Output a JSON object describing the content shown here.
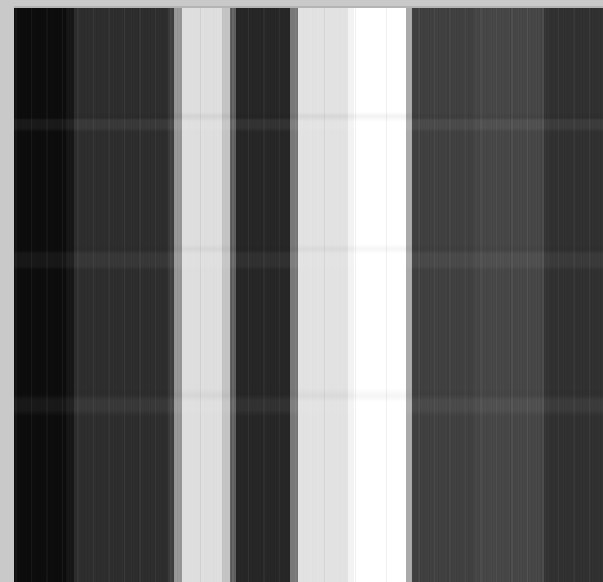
{
  "figure": {
    "title": "",
    "type": "grayscale-vertical-band-raster",
    "width_px": 603,
    "height_px": 582,
    "background_color": "#c9c9c9",
    "plot_area": {
      "left_px": 14,
      "top_px": 8,
      "width_px": 589,
      "height_px": 574
    },
    "colormap": "gray",
    "border": {
      "top_strip_color": "#c9c9c9",
      "top_strip_height_px": 8,
      "left_strip_color": "#c9c9c9",
      "left_strip_width_px": 14,
      "hairline_color": "#b4b4b4"
    }
  },
  "chart_data": {
    "type": "heatmap",
    "title": "",
    "xlabel": "",
    "ylabel": "",
    "grid": false,
    "legend": "none",
    "colormap": "gray",
    "value_range": [
      0,
      255
    ],
    "orientation": "vertical-bands",
    "xlim": [
      0,
      589
    ],
    "ylim": [
      0,
      574
    ],
    "horizontal_seams_y": [
      116,
      250,
      396
    ],
    "columns": [
      {
        "x_start": 0,
        "x_end": 52,
        "gray": 12,
        "hex": "#0c0c0c",
        "label": "very-dark-1"
      },
      {
        "x_start": 52,
        "x_end": 60,
        "gray": 22,
        "hex": "#161616",
        "label": "very-dark-2"
      },
      {
        "x_start": 60,
        "x_end": 154,
        "gray": 45,
        "hex": "#2d2d2d",
        "label": "dark-1"
      },
      {
        "x_start": 154,
        "x_end": 160,
        "gray": 60,
        "hex": "#3c3c3c",
        "label": "dark-edge"
      },
      {
        "x_start": 160,
        "x_end": 168,
        "gray": 150,
        "hex": "#969696",
        "label": "ramp-up-1"
      },
      {
        "x_start": 168,
        "x_end": 208,
        "gray": 222,
        "hex": "#dedede",
        "label": "light-1"
      },
      {
        "x_start": 208,
        "x_end": 216,
        "gray": 196,
        "hex": "#c4c4c4",
        "label": "light-1-edge"
      },
      {
        "x_start": 216,
        "x_end": 222,
        "gray": 96,
        "hex": "#606060",
        "label": "ramp-down-1"
      },
      {
        "x_start": 222,
        "x_end": 276,
        "gray": 38,
        "hex": "#262626",
        "label": "dark-2"
      },
      {
        "x_start": 276,
        "x_end": 284,
        "gray": 120,
        "hex": "#787878",
        "label": "ramp-up-2"
      },
      {
        "x_start": 284,
        "x_end": 334,
        "gray": 226,
        "hex": "#e2e2e2",
        "label": "light-2"
      },
      {
        "x_start": 334,
        "x_end": 340,
        "gray": 243,
        "hex": "#f3f3f3",
        "label": "ramp-to-white"
      },
      {
        "x_start": 340,
        "x_end": 392,
        "gray": 255,
        "hex": "#ffffff",
        "label": "white-peak"
      },
      {
        "x_start": 392,
        "x_end": 398,
        "gray": 170,
        "hex": "#aaaaaa",
        "label": "ramp-down-2"
      },
      {
        "x_start": 398,
        "x_end": 460,
        "gray": 64,
        "hex": "#404040",
        "label": "mid-dark-1"
      },
      {
        "x_start": 460,
        "x_end": 530,
        "gray": 70,
        "hex": "#464646",
        "label": "mid-dark-striped"
      },
      {
        "x_start": 530,
        "x_end": 536,
        "gray": 52,
        "hex": "#343434",
        "label": "seam"
      },
      {
        "x_start": 536,
        "x_end": 589,
        "gray": 48,
        "hex": "#303030",
        "label": "dark-3"
      }
    ]
  },
  "regions": {
    "very_dark_left": "#0c0c0c",
    "dark_band_a": "#2d2d2d",
    "light_band_a": "#dedede",
    "dark_band_b": "#262626",
    "light_band_b": "#e2e2e2",
    "white_peak": "#ffffff",
    "mid_dark_right": "#404040",
    "dark_band_c": "#303030"
  }
}
